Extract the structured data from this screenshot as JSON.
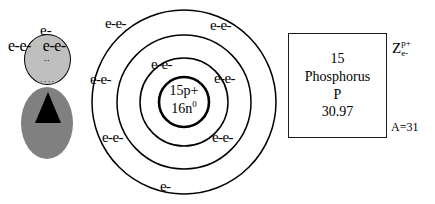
{
  "diagram": {
    "person": {
      "label_top": "e-",
      "label_row_left": "e-e-",
      "label_row_right": "e-e-",
      "mid_dots": "..",
      "lower_dots": "...."
    },
    "atom": {
      "nucleus": {
        "protons": "15p+",
        "neutrons_base": "16n",
        "neutrons_sup": "0"
      },
      "shell_labels": [
        {
          "text": "e-e-",
          "x": 17,
          "y": 14
        },
        {
          "text": "e-e-",
          "x": 122,
          "y": 16
        },
        {
          "text": "e-e-",
          "x": 2,
          "y": 70
        },
        {
          "text": "e-e-",
          "x": 63,
          "y": 55
        },
        {
          "text": "e-e-",
          "x": 126,
          "y": 69
        },
        {
          "text": "e-e-",
          "x": 14,
          "y": 128
        },
        {
          "text": "e-e-",
          "x": 124,
          "y": 128
        },
        {
          "text": "e-",
          "x": 72,
          "y": 177
        }
      ],
      "shells": [
        {
          "r": 92,
          "label": "outer-shell"
        },
        {
          "r": 67,
          "label": "middle-shell"
        },
        {
          "r": 44,
          "label": "inner-shell"
        },
        {
          "r": 25,
          "label": "nucleus-circle"
        }
      ]
    },
    "element_box": {
      "atomic_number": "15",
      "name": "Phosphorus",
      "symbol": "P",
      "atomic_mass": "30.97"
    },
    "annotations": {
      "z_symbol": "Z",
      "z_sup": "p",
      "z_sup_charge": "+",
      "z_sub": "e",
      "z_sub_charge": "-",
      "mass_number": "A=31"
    },
    "colors": {
      "head_fill": "#bfbfbf",
      "body_fill": "#808080",
      "stroke": "#000000",
      "background": "#ffffff"
    }
  }
}
